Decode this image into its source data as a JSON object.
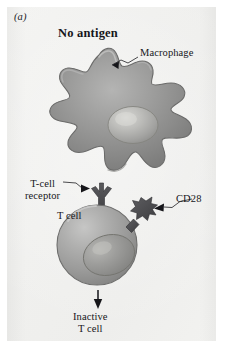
{
  "figure": {
    "panel_letter": "(a)",
    "title": "No antigen",
    "background_color": "#f1f1ef",
    "page_color": "#ffffff"
  },
  "labels": {
    "macrophage": "Macrophage",
    "tcell_receptor_line1": "T-cell",
    "tcell_receptor_line2": "receptor",
    "cd28": "CD28",
    "tcell": "T cell",
    "outcome_line1": "Inactive",
    "outcome_line2": "T cell"
  },
  "cells": {
    "macrophage": {
      "name": "macrophage",
      "shape": "amoeboid-with-pseudopods",
      "body_color": "#8d8d8d",
      "highlight_color": "#b2b2b2",
      "outline_color": "#5d5d5d",
      "nucleus_color": "#9d9d9b",
      "nucleus_highlight": "#c9c9c6"
    },
    "tcell": {
      "name": "t-cell",
      "shape": "round",
      "body_color": "#9b9b9b",
      "highlight_color": "#c0c0c0",
      "outline_color": "#6a6a6a",
      "nucleus_color": "#8b8b89",
      "nucleus_highlight": "#ababa8"
    }
  },
  "receptors": {
    "tcell_receptor": {
      "name": "t-cell-receptor",
      "glyph": "y-shaped-fork",
      "color": "#4c4c4f"
    },
    "cd28": {
      "name": "cd28-receptor",
      "glyph": "star-burst-on-stem",
      "color": "#4c4c4f"
    }
  },
  "arrows": {
    "macrophage_leader": "leader-line-to-macrophage",
    "tcell_receptor_leader": "leader-line-to-t-cell-receptor",
    "cd28_leader": "leader-line-to-cd28",
    "outcome": "down-arrow-to-inactive-t-cell"
  }
}
